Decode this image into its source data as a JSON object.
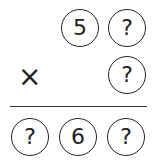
{
  "problem": {
    "multiplicand": [
      "5",
      "?"
    ],
    "multiplier": [
      "?"
    ],
    "operator": "×",
    "product": [
      "?",
      "6",
      "?"
    ]
  },
  "colors": {
    "stroke": "#222222",
    "background": "#ffffff"
  }
}
